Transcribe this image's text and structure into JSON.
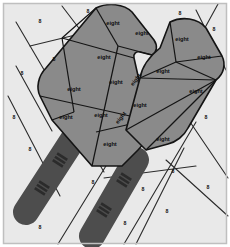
{
  "image": {
    "title": "Segmented glove illustration with region labels",
    "width": 230,
    "height": 247,
    "background_color": "#ffffff",
    "frame_color": "#bfbfbf"
  },
  "palette": {
    "page_background": "#ffffff",
    "light_region": "#e9e9e9",
    "mid_region": "#8a8a8a",
    "dark_region": "#4d4d4d",
    "darkest_stripe": "#2a2a2a",
    "outline": "#1a1a1a",
    "thin_line": "#2b2b2b",
    "label_text": "#111111"
  },
  "labels": {
    "background_label": "8",
    "object_label": "eight"
  },
  "background_regions": [
    {
      "id": "bg-top-left",
      "label": "8",
      "x": 40,
      "y": 22
    },
    {
      "id": "bg-top-mid",
      "label": "8",
      "x": 88,
      "y": 12
    },
    {
      "id": "bg-top-right",
      "label": "8",
      "x": 180,
      "y": 14
    },
    {
      "id": "bg-top-right-edge",
      "label": "8",
      "x": 214,
      "y": 30
    },
    {
      "id": "bg-left-upper",
      "label": "8",
      "x": 54,
      "y": 60
    },
    {
      "id": "bg-left-mid",
      "label": "8",
      "x": 22,
      "y": 74
    },
    {
      "id": "bg-left-lower",
      "label": "8",
      "x": 14,
      "y": 118
    },
    {
      "id": "bg-left-bottom",
      "label": "8",
      "x": 30,
      "y": 150
    },
    {
      "id": "bg-left-foot",
      "label": "8",
      "x": 40,
      "y": 228
    },
    {
      "id": "bg-center-bottom",
      "label": "8",
      "x": 93,
      "y": 183
    },
    {
      "id": "bg-center-foot",
      "label": "8",
      "x": 125,
      "y": 224
    },
    {
      "id": "bg-right-mid",
      "label": "8",
      "x": 206,
      "y": 118
    },
    {
      "id": "bg-right-lower",
      "label": "8",
      "x": 173,
      "y": 172
    },
    {
      "id": "bg-right-lower2",
      "label": "8",
      "x": 143,
      "y": 190
    },
    {
      "id": "bg-right-edge",
      "label": "8",
      "x": 208,
      "y": 188
    },
    {
      "id": "bg-right-bottom",
      "label": "8",
      "x": 167,
      "y": 212
    }
  ],
  "object_regions": [
    {
      "id": "glove-a-thumbtip",
      "label": "eight",
      "x": 113,
      "y": 24,
      "rotation": 0
    },
    {
      "id": "glove-a-thumbside",
      "label": "eight",
      "x": 142,
      "y": 34,
      "rotation": 0
    },
    {
      "id": "glove-a-upper-mid",
      "label": "eight",
      "x": 104,
      "y": 58,
      "rotation": 0
    },
    {
      "id": "glove-a-left-palm",
      "label": "eight",
      "x": 74,
      "y": 90,
      "rotation": 0
    },
    {
      "id": "glove-a-center-palm",
      "label": "eight",
      "x": 116,
      "y": 83,
      "rotation": 0
    },
    {
      "id": "glove-a-left-lower",
      "label": "eight",
      "x": 66,
      "y": 118,
      "rotation": 0
    },
    {
      "id": "glove-a-mid-lower",
      "label": "eight",
      "x": 101,
      "y": 116,
      "rotation": 0
    },
    {
      "id": "glove-a-bottom",
      "label": "eight",
      "x": 110,
      "y": 145,
      "rotation": 0
    },
    {
      "id": "glove-a-seam-upper",
      "label": "eight",
      "x": 136,
      "y": 80,
      "rotation": -52
    },
    {
      "id": "glove-a-seam-lower",
      "label": "eight",
      "x": 121,
      "y": 118,
      "rotation": -52
    },
    {
      "id": "glove-b-thumbtip",
      "label": "eight",
      "x": 182,
      "y": 40,
      "rotation": 0
    },
    {
      "id": "glove-b-thumbside",
      "label": "eight",
      "x": 204,
      "y": 58,
      "rotation": 0
    },
    {
      "id": "glove-b-upper-mid",
      "label": "eight",
      "x": 163,
      "y": 72,
      "rotation": 0
    },
    {
      "id": "glove-b-right-palm",
      "label": "eight",
      "x": 196,
      "y": 92,
      "rotation": 0
    },
    {
      "id": "glove-b-mid-palm",
      "label": "eight",
      "x": 140,
      "y": 106,
      "rotation": 0
    },
    {
      "id": "glove-b-lower-right",
      "label": "eight",
      "x": 163,
      "y": 140,
      "rotation": 0
    }
  ],
  "geometry": {
    "frame": {
      "x": 3,
      "y": 3,
      "w": 224,
      "h": 241
    },
    "background_lines": [
      "M 16 22 L 104 172",
      "M 16 66 L 52 131",
      "M 8 96 L 60 196",
      "M 62 6 L 120 82",
      "M 30 46 L 96 30",
      "M 218 4 L 150 128",
      "M 196 10 L 226 70",
      "M 186 116 L 228 178",
      "M 104 178 L 196 166",
      "M 166 160 L 228 216",
      "M 136 244 L 184 148",
      "M 58 244 L 128 130",
      "M 124 244 L 196 122"
    ],
    "glove_a": {
      "outline": "M 96 8 C 108 2 124 4 132 12 L 154 40 C 158 46 157 52 152 55 L 140 52 C 136 51 133 54 134 58 L 148 120 C 150 132 146 142 138 150 L 122 166 L 92 166 L 52 120 L 40 96 C 36 88 38 76 46 68 Z",
      "cuts": [
        "M 62 38 L 96 8",
        "M 62 38 L 74 112",
        "M 62 38 L 134 58",
        "M 96 8 L 118 46",
        "M 118 46 L 152 55",
        "M 40 96 L 148 120",
        "M 118 46 L 92 166",
        "M 96 132 L 148 120",
        "M 74 112 L 52 120"
      ]
    },
    "glove_b": {
      "outline": "M 170 22 C 182 16 198 18 206 28 L 222 56 C 226 64 224 74 216 80 L 188 128 C 184 136 176 142 168 144 L 146 150 L 126 130 L 140 78 C 142 66 150 56 160 48 Z",
      "cuts": [
        "M 170 22 L 176 62",
        "M 176 62 L 222 56",
        "M 176 62 L 216 80",
        "M 140 78 L 216 80",
        "M 176 62 L 140 78",
        "M 216 80 L 146 150",
        "M 216 80 L 126 130"
      ]
    },
    "sticks": [
      {
        "id": "stick-left",
        "x1": 74,
        "y1": 138,
        "x2": 26,
        "y2": 212,
        "width": 26,
        "stripes": [
          {
            "cx": 60,
            "cy": 160,
            "angle": -57
          },
          {
            "cx": 42,
            "cy": 188,
            "angle": -57
          }
        ]
      },
      {
        "id": "stick-right",
        "x1": 136,
        "y1": 160,
        "x2": 92,
        "y2": 236,
        "width": 26,
        "stripes": [
          {
            "cx": 124,
            "cy": 180,
            "angle": -57
          },
          {
            "cx": 104,
            "cy": 210,
            "angle": -57
          }
        ]
      }
    ]
  }
}
